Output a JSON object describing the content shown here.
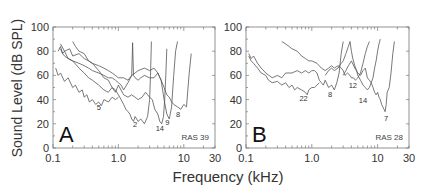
{
  "chart_data": [
    {
      "type": "line",
      "panel": "A",
      "panel_label": "A",
      "annotation": "RAS 39",
      "xlabel": "Frequency (kHz)",
      "ylabel": "Sound Level (dB SPL)",
      "xscale": "log",
      "xlim": [
        0.1,
        30
      ],
      "ylim": [
        0,
        100
      ],
      "xticks": [
        "0.1",
        "1.0",
        "10",
        "30"
      ],
      "yticks": [
        "0",
        "20",
        "40",
        "60",
        "80",
        "100"
      ],
      "grid": false,
      "series": [
        {
          "name": "5",
          "label_pos": [
            0.5,
            31
          ],
          "x": [
            0.11,
            0.12,
            0.13,
            0.15,
            0.17,
            0.2,
            0.22,
            0.25,
            0.28,
            0.3,
            0.33,
            0.36,
            0.4,
            0.45,
            0.5,
            0.55,
            0.6,
            0.7,
            0.8,
            0.9,
            1.0
          ],
          "y": [
            66,
            60,
            62,
            55,
            58,
            50,
            52,
            46,
            48,
            42,
            44,
            38,
            40,
            36,
            38,
            35,
            40,
            38,
            42,
            40,
            42
          ]
        },
        {
          "name": "2",
          "label_pos": [
            1.8,
            17
          ],
          "x": [
            0.2,
            0.22,
            0.25,
            0.3,
            0.35,
            0.4,
            0.5,
            0.6,
            0.7,
            0.8,
            0.9,
            1.0,
            1.1,
            1.2,
            1.3,
            1.4,
            1.5,
            1.6,
            1.7,
            1.8,
            2.0,
            2.2,
            2.5,
            2.8,
            3.0,
            3.1,
            3.2
          ],
          "y": [
            88,
            84,
            80,
            78,
            72,
            70,
            64,
            58,
            56,
            50,
            48,
            44,
            40,
            36,
            32,
            30,
            28,
            24,
            22,
            26,
            22,
            24,
            20,
            26,
            40,
            60,
            88
          ]
        },
        {
          "name": "14",
          "label_pos": [
            4.3,
            14
          ],
          "x": [
            0.13,
            0.14,
            0.15,
            0.17,
            0.2,
            0.25,
            0.3,
            0.35,
            0.4,
            0.5,
            0.6,
            0.7,
            0.8,
            0.9,
            1.0,
            1.2,
            1.4,
            1.6,
            1.8,
            2.0,
            2.3,
            2.6,
            3.0,
            3.3,
            3.6,
            4.0,
            4.3,
            4.6,
            4.9,
            5.1,
            5.3,
            5.5
          ],
          "y": [
            82,
            78,
            80,
            74,
            72,
            66,
            62,
            58,
            56,
            52,
            48,
            46,
            50,
            46,
            52,
            44,
            42,
            44,
            42,
            40,
            42,
            46,
            42,
            40,
            32,
            28,
            22,
            20,
            26,
            40,
            60,
            82
          ]
        },
        {
          "name": "9",
          "label_pos": [
            5.6,
            19
          ],
          "x": [
            0.12,
            0.13,
            0.14,
            0.15,
            0.17,
            0.2,
            0.25,
            0.3,
            0.35,
            0.4,
            0.5,
            0.6,
            0.7,
            0.8,
            0.9,
            1.0,
            1.1,
            1.2,
            1.4,
            1.6,
            1.8,
            2.0,
            2.5,
            3.0,
            3.5,
            4.0,
            4.5,
            5.0,
            5.5,
            6.0,
            6.5,
            7.0,
            7.5,
            8.0
          ],
          "y": [
            80,
            84,
            78,
            76,
            74,
            72,
            70,
            68,
            66,
            64,
            62,
            60,
            58,
            58,
            56,
            54,
            52,
            48,
            54,
            60,
            62,
            64,
            66,
            64,
            66,
            62,
            56,
            40,
            28,
            24,
            34,
            60,
            80,
            88
          ]
        },
        {
          "name": "8",
          "label_pos": [
            8.2,
            26
          ],
          "x": [
            0.13,
            0.15,
            0.18,
            0.2,
            0.25,
            0.3,
            0.35,
            0.4,
            0.5,
            0.6,
            0.7,
            0.8,
            0.9,
            1.0,
            1.2,
            1.4,
            1.6,
            1.65,
            1.7,
            1.8,
            2.0,
            2.2,
            2.5,
            3.0,
            3.5,
            4.0,
            4.5,
            5.0,
            5.5,
            6.0,
            6.5,
            7.0,
            8.0,
            9.0,
            10.0,
            11.0,
            12.0,
            13.0
          ],
          "y": [
            86,
            80,
            82,
            76,
            78,
            74,
            72,
            70,
            68,
            66,
            64,
            62,
            60,
            58,
            58,
            56,
            60,
            87,
            60,
            58,
            56,
            58,
            60,
            58,
            58,
            62,
            56,
            50,
            44,
            42,
            38,
            36,
            34,
            32,
            36,
            34,
            60,
            78
          ]
        }
      ]
    },
    {
      "type": "line",
      "panel": "B",
      "panel_label": "B",
      "annotation": "RAS 28",
      "xlabel": "Frequency (kHz)",
      "ylabel": "Sound Level (dB SPL)",
      "xscale": "log",
      "xlim": [
        0.1,
        30
      ],
      "ylim": [
        0,
        100
      ],
      "xticks": [
        "0.1",
        "1.0",
        "10",
        "30"
      ],
      "yticks": [
        "0",
        "20",
        "40",
        "60",
        "80",
        "100"
      ],
      "grid": false,
      "series": [
        {
          "name": "22",
          "label_pos": [
            0.75,
            39
          ],
          "x": [
            0.11,
            0.12,
            0.13,
            0.15,
            0.17,
            0.2,
            0.22,
            0.25,
            0.3,
            0.35,
            0.4,
            0.45,
            0.5,
            0.55,
            0.6,
            0.7,
            0.8,
            0.85,
            0.9,
            1.0,
            1.1,
            1.2,
            1.3
          ],
          "y": [
            76,
            72,
            70,
            66,
            62,
            60,
            56,
            54,
            55,
            52,
            54,
            50,
            52,
            48,
            50,
            48,
            46,
            44,
            48,
            50,
            50,
            52,
            54
          ]
        },
        {
          "name": "8",
          "label_pos": [
            1.9,
            42
          ],
          "x": [
            0.11,
            0.12,
            0.13,
            0.15,
            0.17,
            0.2,
            0.25,
            0.3,
            0.35,
            0.4,
            0.5,
            0.6,
            0.7,
            0.8,
            0.9,
            1.0,
            1.1,
            1.2,
            1.3,
            1.4,
            1.5,
            1.6,
            1.8,
            2.0,
            2.2,
            2.4,
            2.6,
            2.8,
            3.0
          ],
          "y": [
            78,
            74,
            76,
            70,
            66,
            62,
            58,
            60,
            58,
            62,
            62,
            64,
            62,
            64,
            62,
            64,
            64,
            62,
            56,
            54,
            52,
            56,
            50,
            52,
            48,
            54,
            62,
            78,
            88
          ]
        },
        {
          "name": "12",
          "label_pos": [
            4.2,
            50
          ],
          "x": [
            0.35,
            0.4,
            0.45,
            0.5,
            0.6,
            0.7,
            0.8,
            0.9,
            1.0,
            1.2,
            1.4,
            1.6,
            1.8,
            2.0,
            2.2,
            2.5,
            2.8,
            3.0,
            3.2,
            3.5,
            3.8,
            4.0,
            4.3,
            4.6,
            5.0,
            5.5,
            6.0,
            6.5,
            7.0,
            7.5
          ],
          "y": [
            88,
            86,
            84,
            82,
            80,
            76,
            74,
            72,
            72,
            70,
            66,
            64,
            66,
            68,
            66,
            68,
            66,
            64,
            60,
            62,
            60,
            58,
            58,
            56,
            58,
            62,
            70,
            78,
            84,
            88
          ]
        },
        {
          "name": "14",
          "label_pos": [
            6.0,
            37
          ],
          "x": [
            1.6,
            1.8,
            2.0,
            2.2,
            2.5,
            2.8,
            3.0,
            3.3,
            3.6,
            3.8,
            4.0,
            4.2,
            4.5,
            4.8,
            5.0,
            5.5,
            6.0,
            6.5,
            7.0,
            7.5,
            8.0,
            8.5,
            9.0,
            9.5,
            10.0,
            10.5,
            11.0
          ],
          "y": [
            60,
            64,
            66,
            64,
            66,
            70,
            72,
            78,
            84,
            88,
            80,
            74,
            68,
            64,
            60,
            56,
            52,
            50,
            48,
            50,
            54,
            58,
            66,
            72,
            80,
            86,
            90
          ]
        },
        {
          "name": "7",
          "label_pos": [
            13.5,
            22
          ],
          "x": [
            3.0,
            3.3,
            3.6,
            4.0,
            4.5,
            5.0,
            5.5,
            6.0,
            6.5,
            7.0,
            7.5,
            8.0,
            8.5,
            9.0,
            9.5,
            10.0,
            10.5,
            11.0,
            11.5,
            12.0,
            12.5,
            13.0,
            13.5,
            14.0,
            15.0,
            16.0,
            17.0,
            18.0
          ],
          "y": [
            60,
            64,
            68,
            72,
            66,
            62,
            60,
            64,
            66,
            58,
            56,
            54,
            50,
            46,
            44,
            46,
            42,
            40,
            36,
            34,
            32,
            30,
            36,
            46,
            50,
            62,
            78,
            88
          ]
        }
      ]
    }
  ],
  "figure": {
    "ylabel": "Sound Level (dB SPL)",
    "xlabel": "Frequency (kHz)"
  }
}
